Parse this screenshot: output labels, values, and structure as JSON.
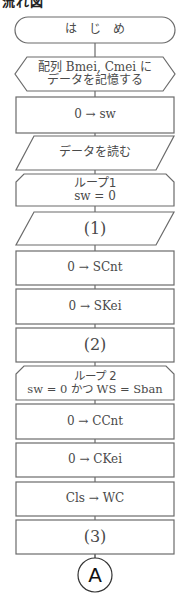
{
  "heading": "流れ図",
  "flowchart": {
    "start": "は　じ　め",
    "prep": [
      "配列 Bmei, Cmei に",
      "データを記憶する"
    ],
    "init_sw": "0 → sw",
    "read": "データを読む",
    "loop1": {
      "title": "ループ1",
      "condition": "sw = 0"
    },
    "step1": "(1)",
    "init_scnt": "0 → SCnt",
    "init_skei": "0 → SKei",
    "step2": "(2)",
    "loop2": {
      "title": "ループ 2",
      "condition": "sw = 0 かつ WS = Sban"
    },
    "init_ccnt": "0 → CCnt",
    "init_ckei": "0 → CKei",
    "assign_wc": "Cls → WC",
    "step3": "(3)",
    "connector": "A"
  },
  "colors": {
    "stroke": "#6b6b6b",
    "text": "#4a4a4a"
  }
}
